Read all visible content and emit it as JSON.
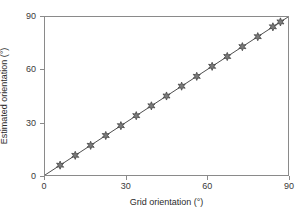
{
  "chart_data": {
    "type": "scatter",
    "title": "",
    "xlabel": "Grid orientation (°)",
    "ylabel": "Estimated orientation (°)",
    "xlim": [
      0,
      90
    ],
    "ylim": [
      0,
      90
    ],
    "xticks": [
      0,
      30,
      60,
      90
    ],
    "yticks": [
      0,
      30,
      60,
      90
    ],
    "xticklabels": [
      "0",
      "30",
      "60",
      "90"
    ],
    "yticklabels": [
      "0",
      "30",
      "60",
      "90"
    ],
    "grid": false,
    "legend": null,
    "marker": "star",
    "marker_color": "#4d4d4d",
    "line_color": "#4d4d4d",
    "frame_color": "#8a8a8a",
    "series": [
      {
        "name": "Estimated vs grid orientation",
        "x": [
          5.6,
          11.2,
          16.9,
          22.5,
          28.1,
          33.8,
          39.4,
          45.0,
          50.6,
          56.2,
          61.9,
          67.5,
          73.1,
          78.8,
          84.4,
          87.2
        ],
        "y": [
          5.6,
          11.2,
          16.9,
          22.5,
          28.1,
          33.8,
          39.4,
          45.0,
          50.6,
          56.2,
          61.9,
          67.5,
          73.1,
          78.8,
          84.4,
          87.2
        ]
      }
    ],
    "reference_line": {
      "name": "identity",
      "x": [
        0,
        90
      ],
      "y": [
        0,
        90
      ]
    }
  }
}
